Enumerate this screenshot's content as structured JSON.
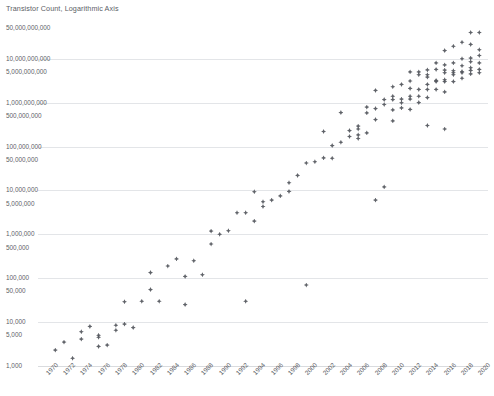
{
  "chart": {
    "title": "Transistor Count, Logarithmic Axis"
  },
  "chart_data": {
    "type": "scatter",
    "title": "Transistor Count, Logarithmic Axis",
    "xlabel": "",
    "ylabel": "",
    "yscale": "log",
    "xlim": [
      1969,
      2021
    ],
    "ylim": [
      1000,
      50000000000
    ],
    "grid": true,
    "legend": "none",
    "marker_color": "#53565c",
    "xticks": [
      "1970",
      "1972",
      "1974",
      "1976",
      "1978",
      "1980",
      "1982",
      "1984",
      "1986",
      "1988",
      "1990",
      "1992",
      "1994",
      "1996",
      "1998",
      "2000",
      "2002",
      "2004",
      "2006",
      "2008",
      "2010",
      "2012",
      "2014",
      "2016",
      "2018",
      "2020"
    ],
    "yticks": [
      {
        "value": 1000,
        "label": "1,000"
      },
      {
        "value": 5000,
        "label": "5,000"
      },
      {
        "value": 10000,
        "label": "10,000"
      },
      {
        "value": 50000,
        "label": "50,000"
      },
      {
        "value": 100000,
        "label": "100,000"
      },
      {
        "value": 500000,
        "label": "500,000"
      },
      {
        "value": 1000000,
        "label": "1,000,000"
      },
      {
        "value": 5000000,
        "label": "5,000,000"
      },
      {
        "value": 10000000,
        "label": "10,000,000"
      },
      {
        "value": 50000000,
        "label": "50,000,000"
      },
      {
        "value": 100000000,
        "label": "100,000,000"
      },
      {
        "value": 500000000,
        "label": "500,000,000"
      },
      {
        "value": 1000000000,
        "label": "1,000,000,000"
      },
      {
        "value": 5000000000,
        "label": "5,000,000,000"
      },
      {
        "value": 10000000000,
        "label": "10,000,000,000"
      },
      {
        "value": 50000000000,
        "label": "50,000,000,000"
      }
    ],
    "gridline_values": [
      1000,
      10000,
      100000,
      1000000,
      10000000,
      100000000,
      1000000000,
      10000000000
    ],
    "points": [
      {
        "x": 1971,
        "y": 2300
      },
      {
        "x": 1972,
        "y": 3500
      },
      {
        "x": 1973,
        "y": 1500
      },
      {
        "x": 1974,
        "y": 4100
      },
      {
        "x": 1974,
        "y": 6000
      },
      {
        "x": 1975,
        "y": 8000
      },
      {
        "x": 1976,
        "y": 5000
      },
      {
        "x": 1976,
        "y": 4500
      },
      {
        "x": 1976,
        "y": 2800
      },
      {
        "x": 1977,
        "y": 3000
      },
      {
        "x": 1978,
        "y": 8500
      },
      {
        "x": 1978,
        "y": 6500
      },
      {
        "x": 1979,
        "y": 9000
      },
      {
        "x": 1979,
        "y": 29000
      },
      {
        "x": 1980,
        "y": 7500
      },
      {
        "x": 1981,
        "y": 30000
      },
      {
        "x": 1982,
        "y": 55000
      },
      {
        "x": 1982,
        "y": 134000
      },
      {
        "x": 1983,
        "y": 30000
      },
      {
        "x": 1984,
        "y": 190000
      },
      {
        "x": 1985,
        "y": 275000
      },
      {
        "x": 1986,
        "y": 25000
      },
      {
        "x": 1986,
        "y": 110000
      },
      {
        "x": 1987,
        "y": 250000
      },
      {
        "x": 1988,
        "y": 120000
      },
      {
        "x": 1989,
        "y": 1180000
      },
      {
        "x": 1989,
        "y": 600000
      },
      {
        "x": 1990,
        "y": 1000000
      },
      {
        "x": 1991,
        "y": 1200000
      },
      {
        "x": 1992,
        "y": 3100000
      },
      {
        "x": 1993,
        "y": 3100000
      },
      {
        "x": 1993,
        "y": 30000
      },
      {
        "x": 1994,
        "y": 2000000
      },
      {
        "x": 1994,
        "y": 9300000
      },
      {
        "x": 1995,
        "y": 5500000
      },
      {
        "x": 1995,
        "y": 4300000
      },
      {
        "x": 1996,
        "y": 6000000
      },
      {
        "x": 1997,
        "y": 7500000
      },
      {
        "x": 1998,
        "y": 9500000
      },
      {
        "x": 1998,
        "y": 15000000
      },
      {
        "x": 1999,
        "y": 22000000
      },
      {
        "x": 2000,
        "y": 70000
      },
      {
        "x": 2000,
        "y": 42000000
      },
      {
        "x": 2001,
        "y": 45000000
      },
      {
        "x": 2002,
        "y": 55000000
      },
      {
        "x": 2002,
        "y": 220000000
      },
      {
        "x": 2003,
        "y": 105000000
      },
      {
        "x": 2003,
        "y": 54000000
      },
      {
        "x": 2004,
        "y": 125000000
      },
      {
        "x": 2004,
        "y": 592000000
      },
      {
        "x": 2005,
        "y": 169000000
      },
      {
        "x": 2005,
        "y": 230000000
      },
      {
        "x": 2006,
        "y": 291000000
      },
      {
        "x": 2006,
        "y": 152000000
      },
      {
        "x": 2006,
        "y": 184000000
      },
      {
        "x": 2006,
        "y": 250000000
      },
      {
        "x": 2007,
        "y": 582000000
      },
      {
        "x": 2007,
        "y": 789000000
      },
      {
        "x": 2007,
        "y": 204000000
      },
      {
        "x": 2008,
        "y": 731000000
      },
      {
        "x": 2008,
        "y": 1900000000
      },
      {
        "x": 2008,
        "y": 410000000
      },
      {
        "x": 2008,
        "y": 6000000
      },
      {
        "x": 2009,
        "y": 904000000
      },
      {
        "x": 2009,
        "y": 1170000000
      },
      {
        "x": 2009,
        "y": 12000000
      },
      {
        "x": 2010,
        "y": 1170000000
      },
      {
        "x": 2010,
        "y": 2300000000
      },
      {
        "x": 2010,
        "y": 1400000000
      },
      {
        "x": 2010,
        "y": 382000000
      },
      {
        "x": 2010,
        "y": 680000000
      },
      {
        "x": 2011,
        "y": 2600000000
      },
      {
        "x": 2011,
        "y": 1200000000
      },
      {
        "x": 2011,
        "y": 995000000
      },
      {
        "x": 2011,
        "y": 758000000
      },
      {
        "x": 2012,
        "y": 5000000000
      },
      {
        "x": 2012,
        "y": 3100000000
      },
      {
        "x": 2012,
        "y": 2100000000
      },
      {
        "x": 2012,
        "y": 1400000000
      },
      {
        "x": 2012,
        "y": 1200000000
      },
      {
        "x": 2012,
        "y": 700000000
      },
      {
        "x": 2013,
        "y": 5000000000
      },
      {
        "x": 2013,
        "y": 4300000000
      },
      {
        "x": 2013,
        "y": 2000000000
      },
      {
        "x": 2013,
        "y": 1400000000
      },
      {
        "x": 2013,
        "y": 1000000000
      },
      {
        "x": 2014,
        "y": 5560000000
      },
      {
        "x": 2014,
        "y": 4300000000
      },
      {
        "x": 2014,
        "y": 3800000000
      },
      {
        "x": 2014,
        "y": 2600000000
      },
      {
        "x": 2014,
        "y": 2000000000
      },
      {
        "x": 2014,
        "y": 1300000000
      },
      {
        "x": 2014,
        "y": 300000000
      },
      {
        "x": 2015,
        "y": 8000000000
      },
      {
        "x": 2015,
        "y": 5700000000
      },
      {
        "x": 2015,
        "y": 3200000000
      },
      {
        "x": 2015,
        "y": 3000000000
      },
      {
        "x": 2015,
        "y": 2000000000
      },
      {
        "x": 2016,
        "y": 15300000000
      },
      {
        "x": 2016,
        "y": 7200000000
      },
      {
        "x": 2016,
        "y": 5500000000
      },
      {
        "x": 2016,
        "y": 4800000000
      },
      {
        "x": 2016,
        "y": 3300000000
      },
      {
        "x": 2016,
        "y": 3000000000
      },
      {
        "x": 2016,
        "y": 1750000000
      },
      {
        "x": 2016,
        "y": 250000000
      },
      {
        "x": 2017,
        "y": 19200000000
      },
      {
        "x": 2017,
        "y": 8000000000
      },
      {
        "x": 2017,
        "y": 5300000000
      },
      {
        "x": 2017,
        "y": 4800000000
      },
      {
        "x": 2017,
        "y": 4300000000
      },
      {
        "x": 2017,
        "y": 3000000000
      },
      {
        "x": 2018,
        "y": 23600000000
      },
      {
        "x": 2018,
        "y": 10000000000
      },
      {
        "x": 2018,
        "y": 6900000000
      },
      {
        "x": 2018,
        "y": 5100000000
      },
      {
        "x": 2018,
        "y": 4800000000
      },
      {
        "x": 2018,
        "y": 3600000000
      },
      {
        "x": 2019,
        "y": 39500000000
      },
      {
        "x": 2019,
        "y": 21100000000
      },
      {
        "x": 2019,
        "y": 10300000000
      },
      {
        "x": 2019,
        "y": 8500000000
      },
      {
        "x": 2019,
        "y": 6200000000
      },
      {
        "x": 2019,
        "y": 5400000000
      },
      {
        "x": 2019,
        "y": 4500000000
      },
      {
        "x": 2020,
        "y": 39500000000
      },
      {
        "x": 2020,
        "y": 16000000000
      },
      {
        "x": 2020,
        "y": 11800000000
      },
      {
        "x": 2020,
        "y": 8000000000
      },
      {
        "x": 2020,
        "y": 5700000000
      },
      {
        "x": 2020,
        "y": 4800000000
      }
    ]
  }
}
